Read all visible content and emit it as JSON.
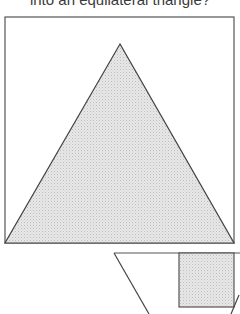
{
  "caption": {
    "text": "into an equilateral triangle?"
  },
  "figure_top": {
    "square": {
      "x": 5,
      "y": 17,
      "width": 229,
      "height": 226
    },
    "triangle": {
      "points": [
        [
          120,
          44
        ],
        [
          5,
          243
        ],
        [
          234,
          243
        ]
      ]
    },
    "stroke": "#555555",
    "fill": "#dedede"
  },
  "figure_bottom": {
    "top_line": {
      "x1": 114,
      "y1": 253,
      "x2": 240,
      "y2": 253
    },
    "left_slant": {
      "x1": 114,
      "y1": 253,
      "x2": 149,
      "y2": 314
    },
    "rect": {
      "x": 179,
      "y": 253,
      "width": 55,
      "height": 54
    },
    "right_slant": {
      "x1": 239,
      "y1": 295,
      "x2": 231,
      "y2": 314
    }
  }
}
